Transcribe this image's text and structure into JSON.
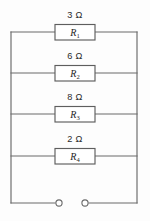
{
  "diagram": {
    "type": "electrical-circuit-schematic",
    "line_color": "#6a6a6a",
    "box_fill": "#ffffff",
    "background": "#fdfdfd",
    "text_color": "#2b2b2b"
  },
  "branches": [
    {
      "id": "branch-1",
      "resistance": "3 Ω",
      "resistor_name": "R",
      "resistor_subscript": "1",
      "y": 32
    },
    {
      "id": "branch-2",
      "resistance": "6 Ω",
      "resistor_name": "R",
      "resistor_subscript": "2",
      "y": 73
    },
    {
      "id": "branch-3",
      "resistance": "8 Ω",
      "resistor_name": "R",
      "resistor_subscript": "3",
      "y": 114
    },
    {
      "id": "branch-4",
      "resistance": "2 Ω",
      "resistor_name": "R",
      "resistor_subscript": "4",
      "y": 156
    }
  ],
  "terminals": {
    "left": {
      "label": "terminal-left",
      "cx": 59,
      "cy": 203
    },
    "right": {
      "label": "terminal-right",
      "cx": 85,
      "cy": 203
    }
  },
  "rails": {
    "left_x": 11,
    "right_x": 137,
    "bottom_y": 203
  }
}
